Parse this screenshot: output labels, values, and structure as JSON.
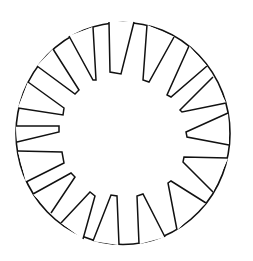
{
  "diagram": {
    "colors": {
      "background": "#ffffff",
      "stroke": "#111111"
    },
    "ring": {
      "cx": 123,
      "cy": 133.5,
      "rx": 107,
      "ry": 111
    },
    "notch_count": 16,
    "notches": [
      [
        [
          109,
          22
        ],
        [
          110,
          72
        ],
        [
          121,
          74
        ],
        [
          134,
          22
        ]
      ],
      [
        [
          147,
          25
        ],
        [
          143,
          80
        ],
        [
          149,
          82
        ],
        [
          174,
          37
        ]
      ],
      [
        [
          189,
          46
        ],
        [
          167,
          95
        ],
        [
          171,
          97
        ],
        [
          207,
          66
        ]
      ],
      [
        [
          213,
          77
        ],
        [
          180,
          110
        ],
        [
          182,
          112
        ],
        [
          226,
          103
        ]
      ],
      [
        [
          228,
          113
        ],
        [
          186,
          132
        ],
        [
          187,
          137
        ],
        [
          229,
          145
        ]
      ],
      [
        [
          228,
          158
        ],
        [
          184,
          157
        ],
        [
          183,
          162
        ],
        [
          213,
          192
        ]
      ],
      [
        [
          206,
          203
        ],
        [
          171,
          181
        ],
        [
          168,
          183
        ],
        [
          177,
          230
        ]
      ],
      [
        [
          165,
          237
        ],
        [
          143,
          194
        ],
        [
          137,
          196
        ],
        [
          139,
          244
        ]
      ],
      [
        [
          119,
          245
        ],
        [
          117,
          196
        ],
        [
          111,
          195
        ],
        [
          93,
          241
        ]
      ],
      [
        [
          83,
          239
        ],
        [
          95,
          196
        ],
        [
          90,
          192
        ],
        [
          61,
          223
        ]
      ],
      [
        [
          51,
          213
        ],
        [
          75,
          177
        ],
        [
          71,
          173
        ],
        [
          33,
          194
        ]
      ],
      [
        [
          26,
          182
        ],
        [
          64,
          163
        ],
        [
          62,
          152
        ],
        [
          18,
          151
        ]
      ],
      [
        [
          17,
          142
        ],
        [
          59,
          132
        ],
        [
          59,
          126
        ],
        [
          16,
          126
        ]
      ],
      [
        [
          18,
          108
        ],
        [
          63,
          115
        ],
        [
          64,
          108
        ],
        [
          28,
          82
        ]
      ],
      [
        [
          37,
          66
        ],
        [
          75,
          94
        ],
        [
          79,
          90
        ],
        [
          53,
          49
        ]
      ],
      [
        [
          69,
          36
        ],
        [
          93,
          80
        ],
        [
          96,
          80
        ],
        [
          93,
          27
        ]
      ]
    ]
  }
}
